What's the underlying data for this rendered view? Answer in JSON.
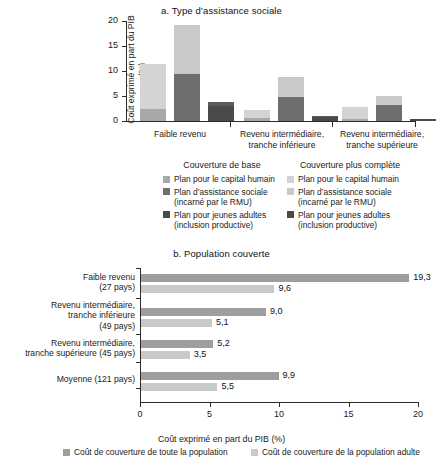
{
  "colors": {
    "light_gray": "#c9c9c9",
    "mid_gray": "#a8a8a8",
    "dark_gray": "#6e6e6e",
    "darker_gray": "#4a4a4a",
    "axis": "#2b2b2b",
    "text": "#111111"
  },
  "panel_a": {
    "title": "a. Type d’assistance sociale",
    "y_axis_title": "Coût exprimé en part du PIB (%)"
  },
  "panel_b": {
    "title": "b. Population couverte",
    "x_axis_title": "Coût exprimé en part du PIB (%)"
  },
  "legend_middle": {
    "col1_title": "Couverture de base",
    "col2_title": "Couverture plus complète",
    "col1_items": [
      {
        "label": "Plan pour le capital humain",
        "color": "#a8a8a8"
      },
      {
        "label": "Plan d’assistance sociale\n(incarné par le RMU)",
        "color": "#6e6e6e"
      },
      {
        "label": "Plan pour jeunes adultes\n(inclusion productive)",
        "color": "#4a4a4a"
      }
    ],
    "col2_items": [
      {
        "label": "Plan pour le capital humain",
        "color": "#d4d4d4"
      },
      {
        "label": "Plan d’assistance sociale\n(incarné par le RMU)",
        "color": "#c9c9c9"
      },
      {
        "label": "Plan pour jeunes adultes\n(inclusion productive)",
        "color": "#4a4a4a"
      }
    ]
  },
  "legend_bottom": {
    "items": [
      {
        "label": "Coût de couverture de toute la population",
        "color": "#9e9e9e"
      },
      {
        "label": "Coût de couverture de la population adulte",
        "color": "#c9c9c9"
      }
    ]
  },
  "chart_data": [
    {
      "type": "bar",
      "id": "panel-a",
      "title": "a. Type d’assistance sociale",
      "xlabel": "",
      "ylabel": "Coût exprimé en part du PIB (%)",
      "ylim": [
        0,
        20
      ],
      "yticks": [
        0,
        5,
        10,
        15,
        20
      ],
      "grid": false,
      "stacked": true,
      "legend_position": "below",
      "categories": [
        "Faible revenu",
        "Revenu intermédiaire,\ntranche inférieure",
        "Revenu intermédiaire,\ntranche supérieure"
      ],
      "groups": [
        {
          "category": "Faible revenu",
          "bars": [
            {
              "name": "Plan pour le capital humain",
              "total": 11.4,
              "segments": [
                {
                  "name": "Couverture de base",
                  "value": 2.5,
                  "color": "#a8a8a8"
                },
                {
                  "name": "Couverture plus complète",
                  "value": 8.9,
                  "color": "#d4d4d4"
                }
              ]
            },
            {
              "name": "Plan d’assistance sociale (incarné par le RMU)",
              "total": 19.2,
              "segments": [
                {
                  "name": "Couverture de base",
                  "value": 9.4,
                  "color": "#6e6e6e"
                },
                {
                  "name": "Couverture plus complète",
                  "value": 9.8,
                  "color": "#c9c9c9"
                }
              ]
            },
            {
              "name": "Plan pour jeunes adultes (inclusion productive)",
              "total": 3.8,
              "segments": [
                {
                  "name": "Couverture de base",
                  "value": 3.0,
                  "color": "#4a4a4a"
                },
                {
                  "name": "Couverture plus complète",
                  "value": 0.8,
                  "color": "#5c5c5c"
                }
              ]
            }
          ]
        },
        {
          "category": "Revenu intermédiaire, tranche inférieure",
          "bars": [
            {
              "name": "Plan pour le capital humain",
              "total": 2.2,
              "segments": [
                {
                  "name": "Couverture de base",
                  "value": 0.6,
                  "color": "#a8a8a8"
                },
                {
                  "name": "Couverture plus complète",
                  "value": 1.6,
                  "color": "#d4d4d4"
                }
              ]
            },
            {
              "name": "Plan d’assistance sociale (incarné par le RMU)",
              "total": 8.8,
              "segments": [
                {
                  "name": "Couverture de base",
                  "value": 4.9,
                  "color": "#6e6e6e"
                },
                {
                  "name": "Couverture plus complète",
                  "value": 3.9,
                  "color": "#c9c9c9"
                }
              ]
            },
            {
              "name": "Plan pour jeunes adultes (inclusion productive)",
              "total": 1.0,
              "segments": [
                {
                  "name": "Couverture de base",
                  "value": 0.8,
                  "color": "#4a4a4a"
                },
                {
                  "name": "Couverture plus complète",
                  "value": 0.2,
                  "color": "#5c5c5c"
                }
              ]
            }
          ]
        },
        {
          "category": "Revenu intermédiaire, tranche supérieure",
          "bars": [
            {
              "name": "Plan pour le capital humain",
              "total": 2.9,
              "segments": [
                {
                  "name": "Couverture de base",
                  "value": 0.5,
                  "color": "#a8a8a8"
                },
                {
                  "name": "Couverture plus complète",
                  "value": 2.4,
                  "color": "#d4d4d4"
                }
              ]
            },
            {
              "name": "Plan d’assistance sociale (incarné par le RMU)",
              "total": 5.1,
              "segments": [
                {
                  "name": "Couverture de base",
                  "value": 3.3,
                  "color": "#6e6e6e"
                },
                {
                  "name": "Couverture plus complète",
                  "value": 1.8,
                  "color": "#c9c9c9"
                }
              ]
            },
            {
              "name": "Plan pour jeunes adultes (inclusion productive)",
              "total": 0.4,
              "segments": [
                {
                  "name": "Couverture de base",
                  "value": 0.4,
                  "color": "#4a4a4a"
                }
              ]
            }
          ]
        }
      ]
    },
    {
      "type": "bar",
      "id": "panel-b",
      "orientation": "horizontal",
      "title": "b. Population couverte",
      "xlabel": "Coût exprimé en part du PIB (%)",
      "ylabel": "",
      "xlim": [
        0,
        20
      ],
      "xticks": [
        0,
        5,
        10,
        15,
        20
      ],
      "grid": false,
      "legend_position": "below",
      "categories": [
        "Faible revenu\n(27 pays)",
        "Revenu intermédiaire,\ntranche inférieure\n(49 pays)",
        "Revenu intermédiaire,\ntranche supérieure (45 pays)",
        "Moyenne (121 pays)"
      ],
      "series": [
        {
          "name": "Coût de couverture de toute la population",
          "color": "#9e9e9e",
          "values": [
            19.3,
            9.0,
            5.2,
            9.9
          ],
          "value_labels": [
            "19,3",
            "9,0",
            "5,2",
            "9,9"
          ]
        },
        {
          "name": "Coût de couverture de la population adulte",
          "color": "#c9c9c9",
          "values": [
            9.6,
            5.1,
            3.5,
            5.5
          ],
          "value_labels": [
            "9,6",
            "5,1",
            "3,5",
            "5,5"
          ]
        }
      ]
    }
  ]
}
